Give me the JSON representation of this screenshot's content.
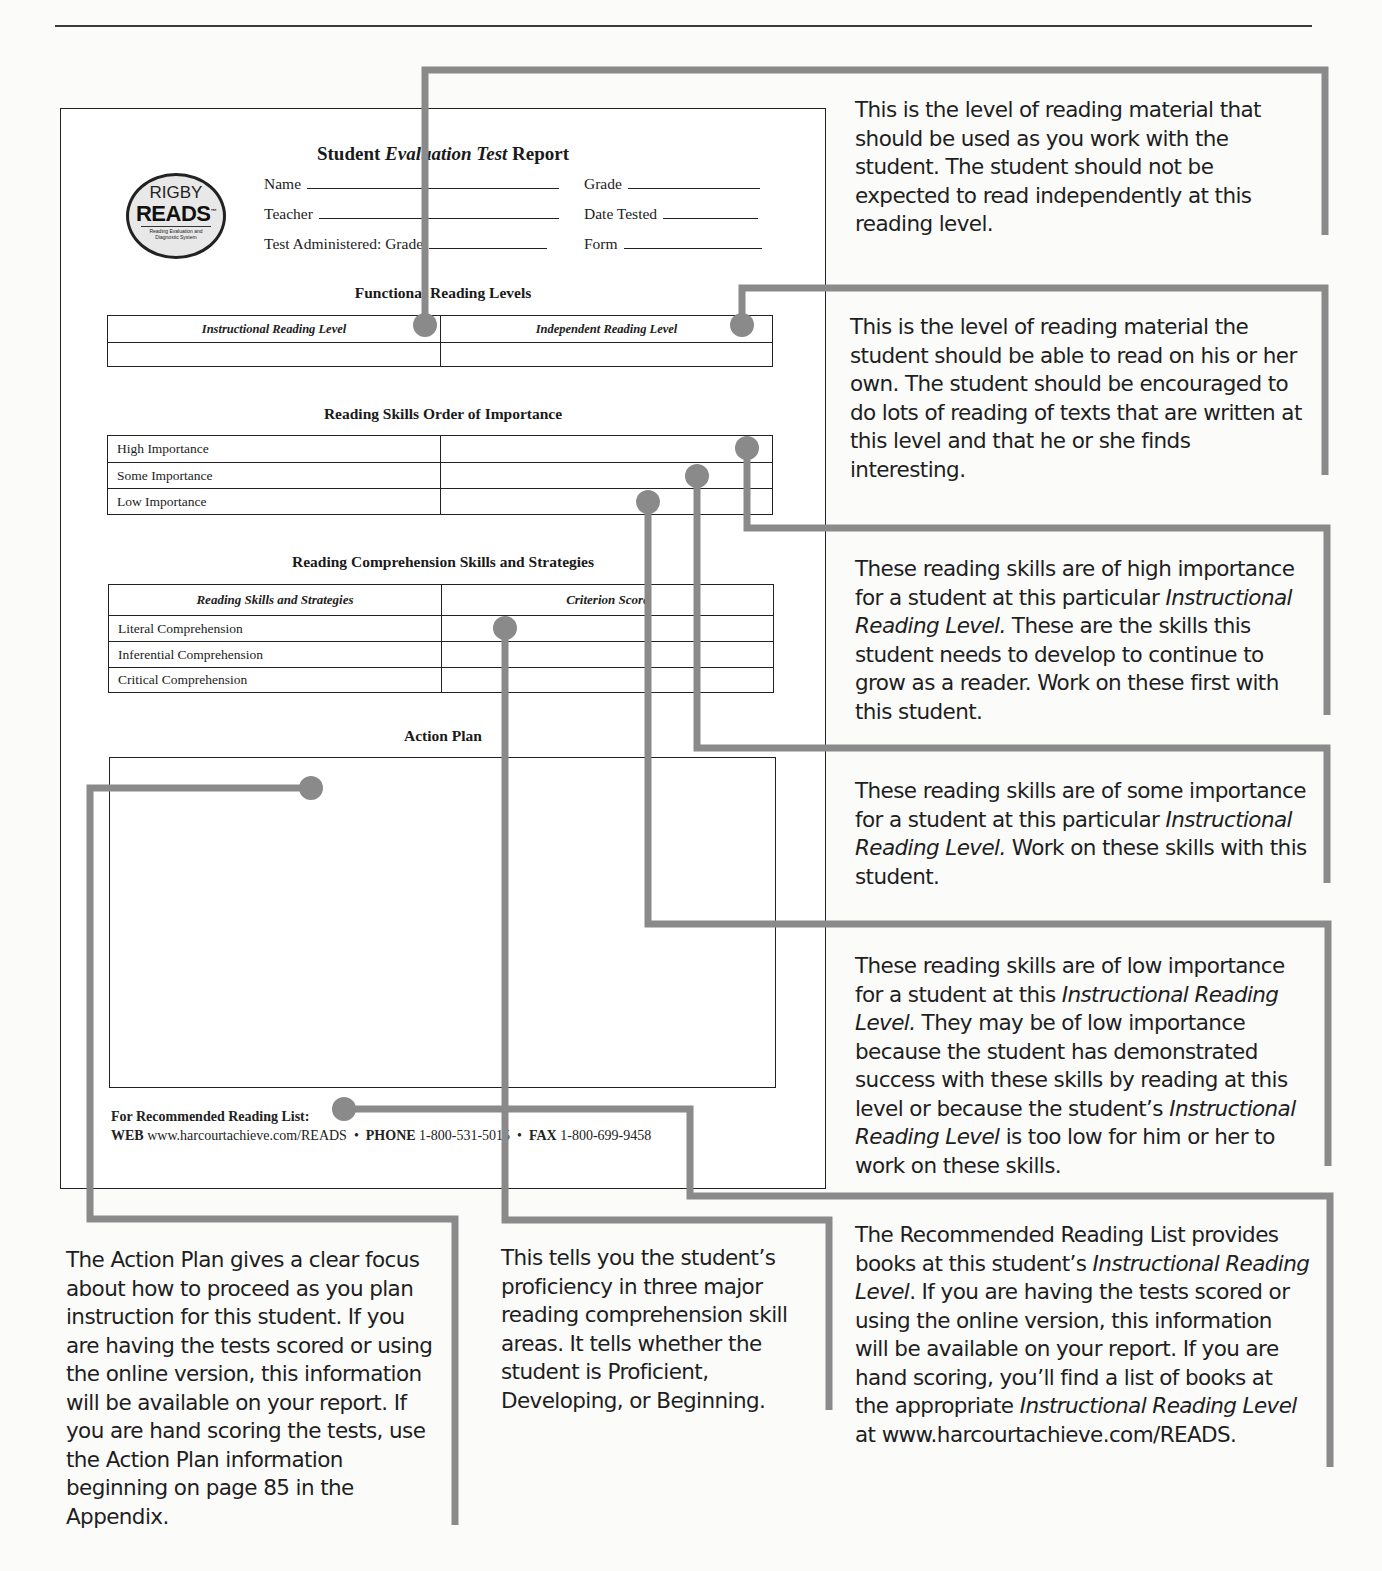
{
  "report": {
    "title_part1": "Student ",
    "title_italic": "Evaluation Test",
    "title_part2": " Report",
    "logo": {
      "line1": "RIGBY",
      "line2": "READS",
      "tm": "™",
      "tagline": "Reading Evaluation and Diagnostic System"
    },
    "fields": {
      "name": "Name",
      "teacher": "Teacher",
      "test_administered": "Test Administered: Grade",
      "grade": "Grade",
      "date_tested": "Date Tested",
      "form": "Form"
    },
    "functional_levels": {
      "title": "Functional Reading Levels",
      "headers": [
        "Instructional Reading Level",
        "Independent Reading Level"
      ],
      "values": [
        "",
        ""
      ]
    },
    "skills_importance": {
      "title": "Reading Skills Order of Importance",
      "rows": [
        {
          "label": "High Importance",
          "value": ""
        },
        {
          "label": "Some Importance",
          "value": ""
        },
        {
          "label": "Low Importance",
          "value": ""
        }
      ]
    },
    "comprehension": {
      "title": "Reading Comprehension Skills and Strategies",
      "headers": [
        "Reading Skills and Strategies",
        "Criterion Score"
      ],
      "rows": [
        {
          "label": "Literal Comprehension",
          "value": ""
        },
        {
          "label": "Inferential Comprehension",
          "value": ""
        },
        {
          "label": "Critical Comprehension",
          "value": ""
        }
      ]
    },
    "action_plan": {
      "title": "Action Plan",
      "content": ""
    },
    "footer": {
      "heading": "For Recommended Reading List:",
      "web_label": "WEB",
      "web_value": "www.harcourtachieve.com/READS",
      "sep": "•",
      "phone_label": "PHONE",
      "phone_value": "1-800-531-5015",
      "fax_label": "FAX",
      "fax_value": "1-800-699-9458"
    }
  },
  "callouts": {
    "instructional": "This is the level of reading material that should be used as you work with the student. The student should not be expected to read independently at this reading level.",
    "independent": "This is the level of reading material the student should be able to read on his or her own. The student should be encouraged to do lots of reading of texts that are written at this level and that he or she finds interesting.",
    "high": {
      "a": "These reading skills are of high importance for a student at this particular ",
      "i": "Instructional Reading Level.",
      "b": " These are the skills this student needs to develop to continue to grow as a reader. Work on these first with this student."
    },
    "some": {
      "a": "These reading skills are of some importance for a student at this particular ",
      "i": "Instructional Reading Level.",
      "b": " Work on these skills with this student."
    },
    "low": {
      "a": "These reading skills are of low importance for a student at this ",
      "i1": "Instructional Reading Level.",
      "b": " They may be of low importance because the student has demonstrated success with these skills by reading at this level or because the student’s ",
      "i2": "Instructional Reading Level",
      "c": " is too low for him or her to work on these skills."
    },
    "reading_list": {
      "a": "The Recommended Reading List provides books at this student’s ",
      "i1": "Instructional Reading Level",
      "b": ". If you are having the tests scored or using the online version, this information will be available on your report. If you are hand scoring, you’ll find a list of books at the appropriate ",
      "i2": "Instructional Reading Level",
      "c": " at www.harcourtachieve.com/READS."
    },
    "action_plan": "The Action Plan gives a clear focus about how to proceed as you plan instruction for this student. If you are having the tests scored or using the online version, this information will be available on your report. If you are hand scoring the tests, use the Action Plan information beginning on page 85 in the Appendix.",
    "comprehension": "This tells you the student’s proficiency in three major reading comprehension skill areas. It tells whether the student is Proficient, Developing, or Beginning."
  },
  "colors": {
    "connector": "#8a8a8a",
    "ink": "#222222"
  }
}
